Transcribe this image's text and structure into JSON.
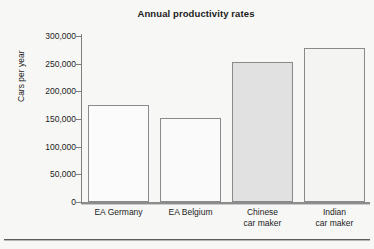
{
  "chart_data": {
    "type": "bar",
    "title": "Annual productivity rates",
    "xlabel": "",
    "ylabel": "Cars per year",
    "categories": [
      "EA Germany",
      "EA Belgium",
      "Chinese car maker",
      "Indian car maker"
    ],
    "category_lines": [
      [
        "EA Germany"
      ],
      [
        "EA Belgium"
      ],
      [
        "Chinese",
        "car maker"
      ],
      [
        "Indian",
        "car maker"
      ]
    ],
    "values": [
      175000,
      152000,
      253000,
      278000
    ],
    "ylim": [
      0,
      300000
    ],
    "ytick_values": [
      0,
      50000,
      100000,
      150000,
      200000,
      250000,
      300000
    ],
    "ytick_labels": [
      "0",
      "50,000",
      "100,000",
      "150,000",
      "200,000",
      "250,000",
      "300,000"
    ],
    "grid": false,
    "legend": null,
    "bar_colors": [
      "#fbfbfb",
      "#fafafa",
      "#e1e1e1",
      "#f4f4f3"
    ],
    "bar_edge_color": "#8a8a8a",
    "axis_color": "#7e7e7e",
    "text_color": "#1d1d1d",
    "background_color": "#f7f7f5"
  },
  "figure": {
    "title": "Annual productivity rates",
    "y_axis_title": "Cars per year"
  }
}
